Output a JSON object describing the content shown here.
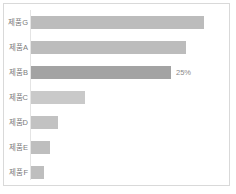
{
  "chart_data": {
    "type": "bar",
    "orientation": "horizontal",
    "title": "",
    "subtitle": "",
    "xlabel": "",
    "ylabel": "",
    "grid": false,
    "legend": null,
    "legend_position": "none",
    "axis": {
      "category_axis": "left",
      "value_axis_visible": false,
      "value_tick_labels": [],
      "xlim": [
        0,
        34
      ]
    },
    "categories": [
      "제품G",
      "제품A",
      "제품B",
      "제품C",
      "제품D",
      "제품E",
      "제품F"
    ],
    "values": [
      32,
      29,
      25,
      10,
      5.5,
      4,
      3
    ],
    "value_unit": "%",
    "bars": [
      {
        "category": "제품G",
        "value": 32,
        "bar_width_px": 173,
        "color": "#bcbcbc",
        "highlighted": false,
        "data_label": ""
      },
      {
        "category": "제품A",
        "value": 29,
        "bar_width_px": 155,
        "color": "#bcbcbc",
        "highlighted": false,
        "data_label": ""
      },
      {
        "category": "제품B",
        "value": 25,
        "bar_width_px": 140,
        "color": "#a3a3a3",
        "highlighted": true,
        "data_label": "25%"
      },
      {
        "category": "제품C",
        "value": 10,
        "bar_width_px": 54,
        "color": "#c9c9c9",
        "highlighted": false,
        "data_label": ""
      },
      {
        "category": "제품D",
        "value": 5.5,
        "bar_width_px": 27,
        "color": "#c2c2c2",
        "highlighted": false,
        "data_label": ""
      },
      {
        "category": "제품E",
        "value": 4,
        "bar_width_px": 19,
        "color": "#bebebe",
        "highlighted": false,
        "data_label": ""
      },
      {
        "category": "제품F",
        "value": 3,
        "bar_width_px": 13,
        "color": "#bebebe",
        "highlighted": false,
        "data_label": ""
      }
    ],
    "colors": {
      "bar_default": "#bcbcbc",
      "bar_highlight": "#a3a3a3",
      "frame_border": "#d9d9d9",
      "axis_line": "#e4e4e4",
      "label_text": "#7b7b7b",
      "value_text": "#8a8a8a",
      "background": "#ffffff"
    }
  }
}
